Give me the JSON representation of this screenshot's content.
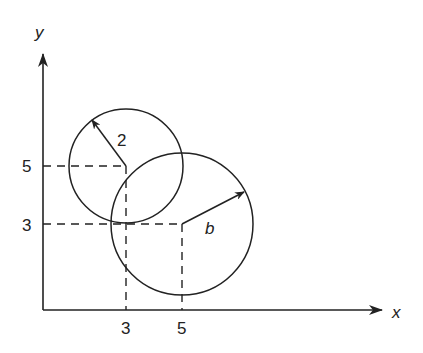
{
  "axes": {
    "x_label": "x",
    "y_label": "y",
    "x_ticks": [
      "3",
      "5"
    ],
    "y_ticks": [
      "5",
      "3"
    ]
  },
  "circles": [
    {
      "name": "small-circle",
      "center": [
        3,
        5
      ],
      "radius_label": "2"
    },
    {
      "name": "large-circle",
      "center": [
        5,
        3
      ],
      "radius_label": "b"
    }
  ],
  "colors": {
    "stroke": "#222222",
    "background": "#ffffff"
  }
}
